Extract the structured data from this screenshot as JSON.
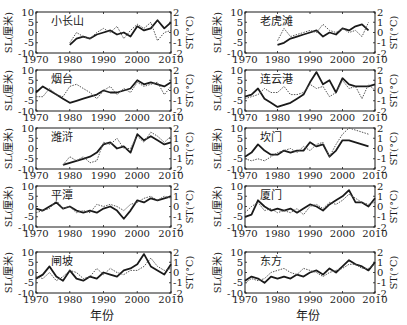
{
  "figure": {
    "xlabel": "年份",
    "left_ylabel": "SL(厘米)",
    "right_ylabel": "ST(°C)",
    "x_ticks": [
      1970,
      1980,
      1990,
      2000,
      2010
    ],
    "left_y_ticks": [
      10,
      5,
      0,
      -5,
      -10
    ],
    "right_y_ticks": [
      2,
      1,
      0,
      -1,
      -2
    ],
    "colors": {
      "sl_line": "#1a1a1a",
      "st_line": "#555555",
      "axis": "#1a1a1a"
    }
  },
  "chart_data": [
    {
      "type": "line",
      "title": "小长山",
      "xlabel": "",
      "ylabel": "SL(厘米)",
      "y2label": "ST(°C)",
      "xlim": [
        1970,
        2010
      ],
      "ylim": [
        -10,
        10
      ],
      "y2lim": [
        -2,
        2
      ],
      "grid": false,
      "series": [
        {
          "name": "SL",
          "style": "solid-thick",
          "x": [
            1980,
            1982,
            1984,
            1986,
            1988,
            1990,
            1992,
            1994,
            1996,
            1998,
            2000,
            2002,
            2004,
            2006,
            2008,
            2010
          ],
          "values": [
            -6,
            -3,
            -2,
            -3,
            -1,
            0,
            1,
            -1,
            0,
            -2,
            3,
            1,
            2,
            6,
            2,
            5
          ]
        },
        {
          "name": "ST",
          "style": "dotted",
          "x": [
            1980,
            1982,
            1984,
            1986,
            1988,
            1990,
            1992,
            1994,
            1996,
            1998,
            2000,
            2002,
            2004,
            2006,
            2008,
            2010
          ],
          "values": [
            -5,
            0,
            -2,
            -3,
            0,
            2,
            0,
            3,
            -3,
            1,
            4,
            2,
            5,
            -4,
            0,
            1
          ]
        }
      ]
    },
    {
      "type": "line",
      "title": "老虎滩",
      "xlabel": "",
      "ylabel": "SL(厘米)",
      "y2label": "ST(°C)",
      "xlim": [
        1970,
        2010
      ],
      "ylim": [
        -10,
        10
      ],
      "y2lim": [
        -2,
        2
      ],
      "grid": false,
      "series": [
        {
          "name": "SL",
          "style": "solid-thick",
          "x": [
            1980,
            1982,
            1984,
            1986,
            1988,
            1990,
            1992,
            1994,
            1996,
            1998,
            2000,
            2002,
            2004,
            2006,
            2008
          ],
          "values": [
            -6,
            -5,
            -3,
            -2,
            -1,
            0,
            1,
            -2,
            0,
            -1,
            2,
            1,
            3,
            4,
            1
          ]
        },
        {
          "name": "ST",
          "style": "dotted",
          "x": [
            1980,
            1982,
            1984,
            1986,
            1988,
            1990,
            1992,
            1994,
            1996,
            1998,
            2000,
            2002,
            2004,
            2006,
            2008
          ],
          "values": [
            -4,
            2,
            -2,
            -1,
            0,
            1,
            0,
            4,
            1,
            0,
            2,
            0,
            1,
            -2,
            5
          ]
        }
      ]
    },
    {
      "type": "line",
      "title": "烟台",
      "xlabel": "",
      "ylabel": "SL(厘米)",
      "y2label": "ST(°C)",
      "xlim": [
        1970,
        2010
      ],
      "ylim": [
        -10,
        10
      ],
      "y2lim": [
        -2,
        2
      ],
      "grid": false,
      "series": [
        {
          "name": "SL",
          "style": "solid-thick",
          "x": [
            1970,
            1972,
            1974,
            1976,
            1978,
            1980,
            1982,
            1984,
            1986,
            1988,
            1990,
            1992,
            1994,
            1996,
            1998,
            2000,
            2002,
            2004,
            2006,
            2008,
            2010
          ],
          "values": [
            -1,
            2,
            0,
            -2,
            -4,
            -6,
            -5,
            -4,
            -3,
            -2,
            0,
            -1,
            -1,
            0,
            1,
            5,
            3,
            4,
            3,
            2,
            4
          ]
        },
        {
          "name": "ST",
          "style": "dotted",
          "x": [
            1970,
            1972,
            1974,
            1976,
            1978,
            1980,
            1982,
            1984,
            1986,
            1988,
            1990,
            1992,
            1994,
            1996,
            1998,
            2000,
            2002,
            2004,
            2006,
            2008,
            2010
          ],
          "values": [
            -3,
            -3,
            1,
            -2,
            -3,
            2,
            3,
            1,
            -1,
            -4,
            0,
            2,
            -2,
            1,
            -1,
            4,
            2,
            3,
            4,
            -2,
            2
          ]
        }
      ]
    },
    {
      "type": "line",
      "title": "连云港",
      "xlabel": "",
      "ylabel": "SL(厘米)",
      "y2label": "ST(°C)",
      "xlim": [
        1970,
        2010
      ],
      "ylim": [
        -10,
        10
      ],
      "y2lim": [
        -2,
        2
      ],
      "grid": false,
      "series": [
        {
          "name": "SL",
          "style": "solid-thick",
          "x": [
            1970,
            1972,
            1974,
            1976,
            1978,
            1980,
            1982,
            1984,
            1986,
            1988,
            1990,
            1992,
            1994,
            1996,
            1998,
            2000,
            2002,
            2004,
            2006,
            2008,
            2010
          ],
          "values": [
            -3,
            -2,
            1,
            -4,
            -6,
            -8,
            -7,
            -6,
            -4,
            -2,
            4,
            9,
            3,
            5,
            -1,
            6,
            3,
            2,
            2,
            2,
            3
          ]
        },
        {
          "name": "ST",
          "style": "dotted",
          "x": [
            1970,
            1972,
            1974,
            1976,
            1978,
            1980,
            1982,
            1984,
            1986,
            1988,
            1990,
            1992,
            1994,
            1996,
            1998,
            2000,
            2002,
            2004,
            2006,
            2008,
            2010
          ],
          "values": [
            -4,
            -3,
            -2,
            1,
            -1,
            -1,
            2,
            -2,
            -2,
            -1,
            3,
            1,
            2,
            -3,
            -1,
            5,
            1,
            2,
            -4,
            3,
            0
          ]
        }
      ]
    },
    {
      "type": "line",
      "title": "潍浒",
      "xlabel": "",
      "ylabel": "SL(厘米)",
      "y2label": "ST(°C)",
      "xlim": [
        1970,
        2010
      ],
      "ylim": [
        -10,
        10
      ],
      "y2lim": [
        -2,
        2
      ],
      "grid": false,
      "series": [
        {
          "name": "SL",
          "style": "solid-thick",
          "x": [
            1978,
            1980,
            1982,
            1984,
            1986,
            1988,
            1990,
            1992,
            1994,
            1996,
            1998,
            2000,
            2002,
            2004,
            2006,
            2008,
            2010
          ],
          "values": [
            -8,
            -7,
            -6,
            -5,
            -4,
            -2,
            2,
            3,
            0,
            1,
            -2,
            7,
            4,
            6,
            4,
            2,
            3
          ]
        },
        {
          "name": "ST",
          "style": "dotted",
          "x": [
            1978,
            1980,
            1982,
            1984,
            1986,
            1988,
            1990,
            1992,
            1994,
            1996,
            1998,
            2000,
            2002,
            2004,
            2006,
            2008,
            2010
          ],
          "values": [
            -8,
            -4,
            -6,
            -4,
            -7,
            -6,
            3,
            2,
            5,
            0,
            0,
            6,
            3,
            8,
            6,
            3,
            6
          ]
        }
      ]
    },
    {
      "type": "line",
      "title": "坎门",
      "xlabel": "",
      "ylabel": "SL(厘米)",
      "y2label": "ST(°C)",
      "xlim": [
        1970,
        2010
      ],
      "ylim": [
        -10,
        10
      ],
      "y2lim": [
        -2,
        2
      ],
      "grid": false,
      "series": [
        {
          "name": "SL",
          "style": "solid-thick",
          "x": [
            1970,
            1972,
            1974,
            1976,
            1978,
            1980,
            1982,
            1984,
            1986,
            1988,
            1990,
            1992,
            1994,
            1996,
            1998,
            2000,
            2002,
            2004,
            2006,
            2008
          ],
          "values": [
            -4,
            -2,
            2,
            -1,
            -3,
            -3,
            -1,
            -2,
            -1,
            -1,
            3,
            1,
            2,
            -4,
            -1,
            4,
            4,
            3,
            2,
            1
          ]
        },
        {
          "name": "ST",
          "style": "dotted",
          "x": [
            1970,
            1972,
            1974,
            1976,
            1978,
            1980,
            1982,
            1984,
            1986,
            1988,
            1990,
            1992,
            1994,
            1996,
            1998,
            2000,
            2002,
            2004,
            2006,
            2008
          ],
          "values": [
            -5,
            -6,
            -5,
            -6,
            -4,
            -2,
            -1,
            0,
            -2,
            1,
            -1,
            2,
            3,
            -4,
            2,
            7,
            10,
            9,
            8,
            7
          ]
        }
      ]
    },
    {
      "type": "line",
      "title": "平潭",
      "xlabel": "",
      "ylabel": "SL(厘米)",
      "y2label": "ST(°C)",
      "xlim": [
        1970,
        2010
      ],
      "ylim": [
        -10,
        10
      ],
      "y2lim": [
        -2,
        2
      ],
      "grid": false,
      "series": [
        {
          "name": "SL",
          "style": "solid-thick",
          "x": [
            1970,
            1972,
            1974,
            1976,
            1978,
            1980,
            1982,
            1984,
            1986,
            1988,
            1990,
            1992,
            1994,
            1996,
            1998,
            2000,
            2002,
            2004,
            2006,
            2008,
            2010
          ],
          "values": [
            -1,
            -2,
            0,
            2,
            -1,
            0,
            -2,
            -3,
            -2,
            -3,
            -1,
            0,
            -2,
            -6,
            -2,
            3,
            2,
            4,
            3,
            4,
            5
          ]
        },
        {
          "name": "ST",
          "style": "dotted",
          "x": [
            1970,
            1972,
            1974,
            1976,
            1978,
            1980,
            1982,
            1984,
            1986,
            1988,
            1990,
            1992,
            1994,
            1996,
            1998,
            2000,
            2002,
            2004,
            2006,
            2008,
            2010
          ],
          "values": [
            -3,
            -2,
            -1,
            3,
            -1,
            0,
            -3,
            -2,
            -3,
            1,
            0,
            1,
            0,
            -2,
            1,
            2,
            4,
            5,
            3,
            5,
            4
          ]
        }
      ]
    },
    {
      "type": "line",
      "title": "厦门",
      "xlabel": "",
      "ylabel": "SL(厘米)",
      "y2label": "ST(°C)",
      "xlim": [
        1970,
        2010
      ],
      "ylim": [
        -10,
        10
      ],
      "y2lim": [
        -2,
        2
      ],
      "grid": false,
      "series": [
        {
          "name": "SL",
          "style": "solid-thick",
          "x": [
            1970,
            1972,
            1974,
            1976,
            1978,
            1980,
            1982,
            1984,
            1986,
            1988,
            1990,
            1992,
            1994,
            1996,
            1998,
            2000,
            2002,
            2004,
            2006,
            2008,
            2010
          ],
          "values": [
            -5,
            -4,
            3,
            0,
            -2,
            -1,
            -2,
            -1,
            -3,
            -1,
            1,
            0,
            -2,
            1,
            3,
            5,
            8,
            2,
            2,
            0,
            4
          ]
        },
        {
          "name": "ST",
          "style": "dotted",
          "x": [
            1970,
            1972,
            1974,
            1976,
            1978,
            1980,
            1982,
            1984,
            1986,
            1988,
            1990,
            1992,
            1994,
            1996,
            1998,
            2000,
            2002,
            2004,
            2006,
            2008,
            2010
          ],
          "values": [
            -3,
            0,
            2,
            -2,
            -1,
            -3,
            -2,
            -3,
            -1,
            -4,
            0,
            1,
            -1,
            2,
            1,
            3,
            6,
            4,
            2,
            1,
            2
          ]
        }
      ]
    },
    {
      "type": "line",
      "title": "闸坡",
      "xlabel": "年份",
      "ylabel": "SL(厘米)",
      "y2label": "ST(°C)",
      "xlim": [
        1970,
        2010
      ],
      "ylim": [
        -10,
        10
      ],
      "y2lim": [
        -2,
        2
      ],
      "grid": false,
      "series": [
        {
          "name": "SL",
          "style": "solid-thick",
          "x": [
            1970,
            1972,
            1974,
            1976,
            1978,
            1980,
            1982,
            1984,
            1986,
            1988,
            1990,
            1992,
            1994,
            1996,
            1998,
            2000,
            2002,
            2004,
            2006,
            2008,
            2010
          ],
          "values": [
            -3,
            -1,
            3,
            -2,
            -4,
            1,
            -3,
            -4,
            -2,
            -3,
            0,
            -1,
            -2,
            1,
            2,
            4,
            9,
            3,
            1,
            -1,
            4
          ]
        },
        {
          "name": "ST",
          "style": "dotted",
          "x": [
            1970,
            1972,
            1974,
            1976,
            1978,
            1980,
            1982,
            1984,
            1986,
            1988,
            1990,
            1992,
            1994,
            1996,
            1998,
            2000,
            2002,
            2004,
            2006,
            2008,
            2010
          ],
          "values": [
            -2,
            -3,
            0,
            -4,
            -2,
            1,
            0,
            -3,
            -2,
            2,
            -1,
            2,
            0,
            -1,
            1,
            1,
            3,
            7,
            3,
            1,
            2
          ]
        }
      ]
    },
    {
      "type": "line",
      "title": "东方",
      "xlabel": "年份",
      "ylabel": "SL(厘米)",
      "y2label": "ST(°C)",
      "xlim": [
        1970,
        2010
      ],
      "ylim": [
        -10,
        10
      ],
      "y2lim": [
        -2,
        2
      ],
      "grid": false,
      "series": [
        {
          "name": "SL",
          "style": "solid-thick",
          "x": [
            1970,
            1972,
            1974,
            1976,
            1978,
            1980,
            1982,
            1984,
            1986,
            1988,
            1990,
            1992,
            1994,
            1996,
            1998,
            2000,
            2002,
            2004,
            2006,
            2008,
            2010
          ],
          "values": [
            -4,
            -2,
            -3,
            -5,
            -2,
            -3,
            -2,
            -3,
            -1,
            -2,
            0,
            1,
            -1,
            2,
            0,
            3,
            6,
            4,
            3,
            1,
            5
          ]
        },
        {
          "name": "ST",
          "style": "dotted",
          "x": [
            1970,
            1972,
            1974,
            1976,
            1978,
            1980,
            1982,
            1984,
            1986,
            1988,
            1990,
            1992,
            1994,
            1996,
            1998,
            2000,
            2002,
            2004,
            2006,
            2008,
            2010
          ],
          "values": [
            -5,
            -3,
            -4,
            -3,
            0,
            1,
            2,
            0,
            -1,
            2,
            1,
            0,
            -2,
            0,
            1,
            2,
            4,
            4,
            2,
            2,
            4
          ]
        }
      ]
    }
  ]
}
